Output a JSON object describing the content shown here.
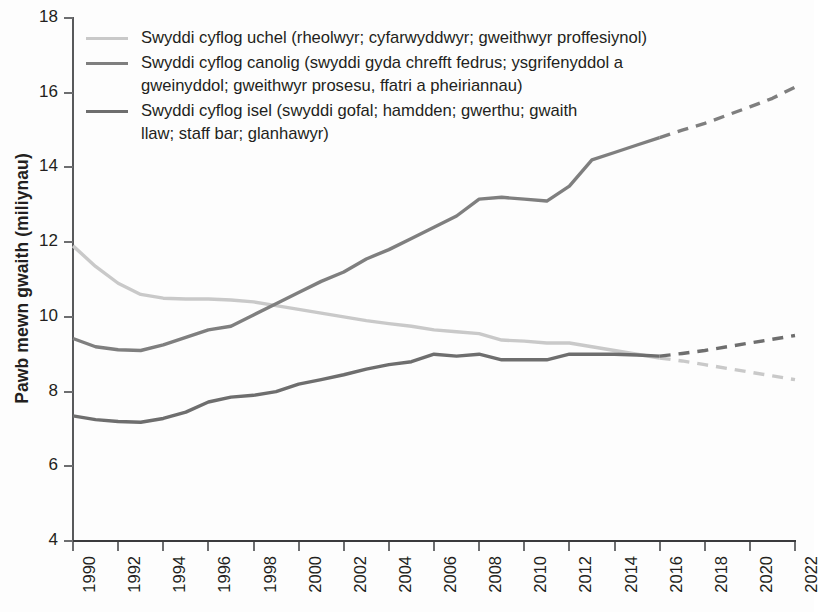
{
  "chart": {
    "ylabel": "Pawb mewn gwaith (miliynau)",
    "xlabel": ""
  },
  "legend": {
    "items": [
      {
        "key": "high",
        "color": "#c9c9c9",
        "label": "Swyddi cyflog uchel (rheolwyr; cyfarwyddwyr; gweithwyr proffesiynol)"
      },
      {
        "key": "mid",
        "color": "#7f7f7f",
        "label": "Swyddi cyflog canolig (swyddi gyda chrefft fedrus; ysgrifenyddol a gweinyddol; gweithwyr prosesu, ffatri a pheiriannau)"
      },
      {
        "key": "low",
        "color": "#6e6e6e",
        "label": "Swyddi cyflog isel (swyddi gofal; hamdden; gwerthu; gwaith llaw; staff bar; glanhawyr)"
      }
    ]
  },
  "axes": {
    "y_ticks": [
      "4",
      "6",
      "8",
      "10",
      "12",
      "14",
      "16",
      "18"
    ],
    "x_ticks": [
      "1990",
      "1992",
      "1994",
      "1996",
      "1998",
      "2000",
      "2002",
      "2004",
      "2006",
      "2008",
      "2010",
      "2012",
      "2014",
      "2016",
      "2018",
      "2020",
      "2022"
    ]
  },
  "chart_data": {
    "type": "line",
    "title": "",
    "xlabel": "",
    "ylabel": "Pawb mewn gwaith (miliynau)",
    "xlim": [
      1990,
      2022
    ],
    "ylim": [
      4,
      18
    ],
    "grid": false,
    "legend_position": "top-left",
    "x": [
      1990,
      1991,
      1992,
      1993,
      1994,
      1995,
      1996,
      1997,
      1998,
      1999,
      2000,
      2001,
      2002,
      2003,
      2004,
      2005,
      2006,
      2007,
      2008,
      2009,
      2010,
      2011,
      2012,
      2013,
      2014,
      2015,
      2016,
      2017,
      2018,
      2019,
      2020,
      2021,
      2022
    ],
    "forecast_start_year": 2016,
    "series": [
      {
        "name": "Swyddi cyflog uchel (rheolwyr; cyfarwyddwyr; gweithwyr proffesiynol)",
        "key": "high",
        "color": "#c9c9c9",
        "values": [
          11.9,
          11.35,
          10.9,
          10.6,
          10.5,
          10.48,
          10.48,
          10.45,
          10.4,
          10.3,
          10.2,
          10.1,
          10.0,
          9.9,
          9.82,
          9.75,
          9.65,
          9.6,
          9.55,
          9.38,
          9.35,
          9.3,
          9.3,
          9.2,
          9.1,
          9.0,
          8.9,
          8.82,
          8.72,
          8.62,
          8.52,
          8.42,
          8.32
        ],
        "style": {
          "solid_through": 2016,
          "dashed_from": 2016
        }
      },
      {
        "name": "Swyddi cyflog canolig (swyddi gyda chrefft fedrus; ysgrifenyddol a gweinyddol; gweithwyr prosesu, ffatri a pheiriannau)",
        "key": "mid",
        "color": "#7f7f7f",
        "values": [
          9.42,
          9.2,
          9.12,
          9.1,
          9.25,
          9.45,
          9.65,
          9.75,
          10.05,
          10.35,
          10.65,
          10.95,
          11.2,
          11.55,
          11.8,
          12.1,
          12.4,
          12.7,
          13.15,
          13.2,
          13.15,
          13.1,
          13.5,
          14.2,
          14.4,
          14.6,
          14.8,
          15.0,
          15.18,
          15.4,
          15.62,
          15.85,
          16.15
        ],
        "style": {
          "solid_through": 2016,
          "dashed_from": 2016
        }
      },
      {
        "name": "Swyddi cyflog isel (swyddi gofal; hamdden; gwerthu; gwaith llaw; staff bar; glanhawyr)",
        "key": "low",
        "color": "#6e6e6e",
        "values": [
          7.35,
          7.25,
          7.2,
          7.18,
          7.28,
          7.45,
          7.72,
          7.85,
          7.9,
          8.0,
          8.2,
          8.32,
          8.45,
          8.6,
          8.72,
          8.8,
          9.0,
          8.95,
          9.0,
          8.85,
          8.85,
          8.85,
          9.0,
          9.0,
          9.0,
          8.98,
          8.95,
          9.02,
          9.1,
          9.2,
          9.3,
          9.4,
          9.5
        ],
        "style": {
          "solid_through": 2016,
          "dashed_from": 2016
        }
      }
    ]
  }
}
